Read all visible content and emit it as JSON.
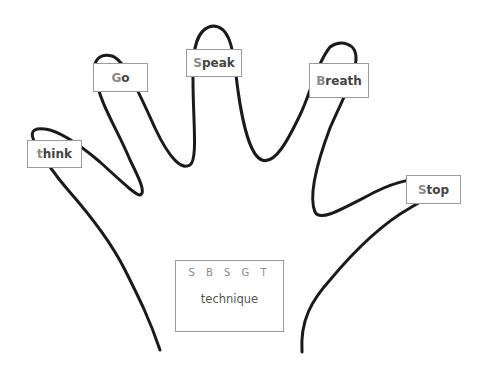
{
  "diagram": {
    "title_acronym": "S B S G T",
    "title_subtitle": "technique",
    "fingers": [
      {
        "id": "thumb",
        "first": "t",
        "rest": "hink",
        "label": "think"
      },
      {
        "id": "index",
        "first": "G",
        "rest": "o",
        "label": "Go"
      },
      {
        "id": "middle",
        "first": "S",
        "rest": "peak",
        "label": "Speak"
      },
      {
        "id": "ring",
        "first": "B",
        "rest": "reath",
        "label": "Breath"
      },
      {
        "id": "pinky",
        "first": "S",
        "rest": "top",
        "label": "Stop"
      }
    ],
    "colors": {
      "outline": "#1a1a1a",
      "box_border": "#9a9a9a",
      "text": "#444444",
      "first_letter": "#8a8a8a"
    }
  }
}
